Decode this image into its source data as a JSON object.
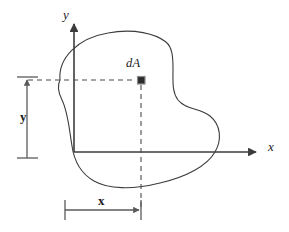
{
  "figure": {
    "width": 289,
    "height": 232,
    "background_color": "#ffffff",
    "line_color": "#3c3c3c",
    "axis_color": "#3c3c3c",
    "text_color": "#1a1a1a",
    "marker_color": "#2b2b2b"
  },
  "axes": {
    "origin": {
      "x": 74,
      "y": 152
    },
    "y_axis": {
      "label": "y",
      "style": "italic",
      "from": {
        "x": 74,
        "y": 152
      },
      "to": {
        "x": 74,
        "y": 22
      },
      "arrowhead": "up"
    },
    "x_axis": {
      "label": "x",
      "style": "italic",
      "from": {
        "x": 74,
        "y": 152
      },
      "to": {
        "x": 258,
        "y": 152
      },
      "arrowhead": "right"
    }
  },
  "area_element": {
    "label": "dA",
    "label_style": "italic",
    "marker_shape": "filled-square",
    "position": {
      "x": 141,
      "y": 80
    },
    "marker_size": 7
  },
  "leader_lines": {
    "horizontal": {
      "description": "dashed line from y dimension to dA marker",
      "from": {
        "x": 28,
        "y": 80
      },
      "to": {
        "x": 138,
        "y": 80
      },
      "style": "dashed"
    },
    "vertical": {
      "description": "dashed line from dA marker down to x dimension",
      "from": {
        "x": 141,
        "y": 84
      },
      "to": {
        "x": 141,
        "y": 206
      },
      "style": "dashed"
    }
  },
  "dimensions": [
    {
      "name": "y-dimension",
      "label": "y",
      "label_style": "upright",
      "orientation": "vertical",
      "line_x": 27,
      "from_y": 158,
      "to_y": 78,
      "arrow_end": "top",
      "cap_end": "bottom"
    },
    {
      "name": "x-dimension",
      "label": "x",
      "label_style": "upright",
      "orientation": "horizontal",
      "line_y": 210,
      "from_x": 65,
      "to_x": 140,
      "arrow_end": "right",
      "cap_end": "left"
    }
  ],
  "shape": {
    "name": "irregular-area-outline",
    "description": "closed irregular blob outline representing a plane area, crossing both the x and y axes",
    "closed": true,
    "fill": "none",
    "stroke_width": 1.1
  }
}
